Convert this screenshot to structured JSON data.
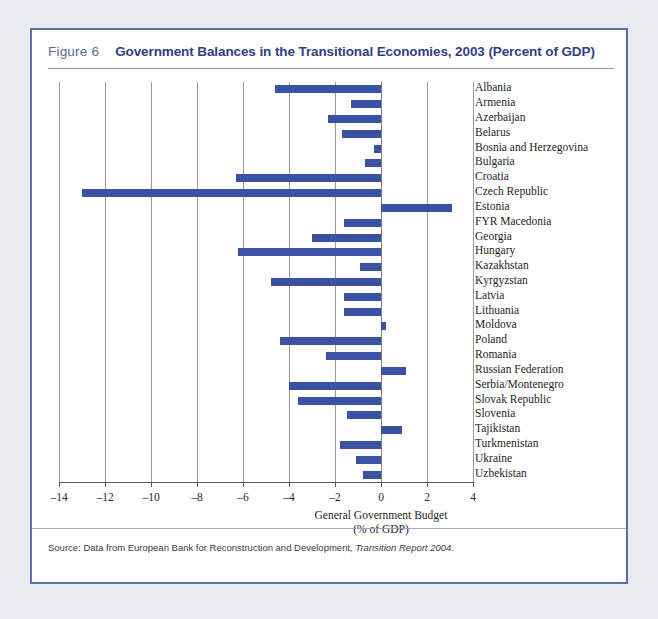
{
  "figure": {
    "number_label": "Figure 6",
    "title": "Government Balances in the Transitional Economies, 2003 (Percent of GDP)",
    "source_prefix": "Source: Data from European Bank for Reconstruction and Development,",
    "source_italic": "Transition Report 2004",
    "source_suffix": "."
  },
  "colors": {
    "bar": "#3b52a4",
    "border": "#5d6ea9",
    "title": "#2f3f86",
    "figure_number": "#5a6aa0",
    "page_background": "#e9ebf1",
    "panel_background": "#ffffff",
    "gridline": "#9a9a9a"
  },
  "chart_data": {
    "type": "bar",
    "orientation": "horizontal",
    "title": "Government Balances in the Transitional Economies, 2003 (Percent of GDP)",
    "xlabel": "General Government Budget",
    "xlabel_line2": "(% of GDP)",
    "ylabel": "",
    "xlim": [
      -14,
      4
    ],
    "xticks": [
      -14,
      -12,
      -10,
      -8,
      -6,
      -4,
      -2,
      0,
      2,
      4
    ],
    "xticklabels": [
      "–14",
      "–12",
      "–10",
      "–8",
      "–6",
      "–4",
      "–2",
      "0",
      "2",
      "4"
    ],
    "grid": true,
    "legend": false,
    "categories": [
      "Albania",
      "Armenia",
      "Azerbaijan",
      "Belarus",
      "Bosnia and Herzegovina",
      "Bulgaria",
      "Croatia",
      "Czech Republic",
      "Estonia",
      "FYR Macedonia",
      "Georgia",
      "Hungary",
      "Kazakhstan",
      "Kyrgyzstan",
      "Latvia",
      "Lithuania",
      "Moldova",
      "Poland",
      "Romania",
      "Russian Federation",
      "Serbia/Montenegro",
      "Slovak Republic",
      "Slovenia",
      "Tajikistan",
      "Turkmenistan",
      "Ukraine",
      "Uzbekistan"
    ],
    "values": [
      -4.6,
      -1.3,
      -2.3,
      -1.7,
      -0.3,
      -0.7,
      -6.3,
      -13.0,
      3.1,
      -1.6,
      -3.0,
      -6.2,
      -0.9,
      -4.8,
      -1.6,
      -1.6,
      0.2,
      -4.4,
      -2.4,
      1.1,
      -4.0,
      -3.6,
      -1.5,
      0.9,
      -1.8,
      -1.1,
      -0.8
    ]
  }
}
